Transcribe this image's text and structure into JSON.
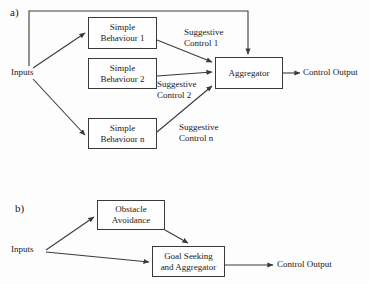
{
  "figure": {
    "type": "block-diagram",
    "background_color": "#fdfdfd",
    "line_color": "#3a3a3a",
    "text_color": "#1a1a1a",
    "panels": [
      {
        "id": "a",
        "label": "a)",
        "nodes": [
          {
            "id": "behaviour1",
            "line1": "Simple",
            "line2": "Behaviour 1"
          },
          {
            "id": "behaviour2",
            "line1": "Simple",
            "line2": "Behaviour 2"
          },
          {
            "id": "behaviourn",
            "line1": "Simple",
            "line2": "Behaviour n"
          },
          {
            "id": "aggregator",
            "line1": "Aggregator",
            "line2": ""
          }
        ],
        "labels": [
          {
            "id": "inputs",
            "text": "Inputs"
          },
          {
            "id": "control_output",
            "text": "Control Output"
          },
          {
            "id": "suggestive_control_1_l1",
            "text": "Suggestive"
          },
          {
            "id": "suggestive_control_1_l2",
            "text": "Control 1"
          },
          {
            "id": "suggestive_control_2_l1",
            "text": "Suggestive"
          },
          {
            "id": "suggestive_control_2_l2",
            "text": "Control 2"
          },
          {
            "id": "suggestive_control_n_l1",
            "text": "Suggestive"
          },
          {
            "id": "suggestive_control_n_l2",
            "text": "Control n"
          }
        ]
      },
      {
        "id": "b",
        "label": "b)",
        "nodes": [
          {
            "id": "obstacle_avoidance",
            "line1": "Obstacle",
            "line2": "Avoidance"
          },
          {
            "id": "goal_seeking",
            "line1": "Goal Seeking",
            "line2": "and Aggregator"
          }
        ],
        "labels": [
          {
            "id": "inputs",
            "text": "Inputs"
          },
          {
            "id": "control_output",
            "text": "Control Output"
          }
        ]
      }
    ]
  }
}
